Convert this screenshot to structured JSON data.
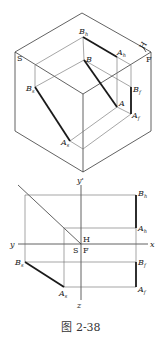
{
  "figure": {
    "caption": "图 2-38"
  },
  "upper_diagram": {
    "planes": {
      "S": "S",
      "F": "F",
      "H": "H"
    },
    "points": {
      "Bh": {
        "base": "B",
        "sub": "h"
      },
      "Ah": {
        "base": "A",
        "sub": "h"
      },
      "B": {
        "base": "B",
        "sub": ""
      },
      "A": {
        "base": "A",
        "sub": ""
      },
      "Bf": {
        "base": "B",
        "sub": "f"
      },
      "Af": {
        "base": "A",
        "sub": "f"
      },
      "Bs": {
        "base": "B",
        "sub": "s"
      },
      "As": {
        "base": "A",
        "sub": "s"
      }
    }
  },
  "lower_diagram": {
    "axes": {
      "x": "x",
      "y": "y",
      "y_prime": "y'",
      "z": "z"
    },
    "planes": {
      "H": "H",
      "S": "S",
      "F": "F"
    },
    "points": {
      "Bh": {
        "base": "B",
        "sub": "h"
      },
      "Ah": {
        "base": "A",
        "sub": "h"
      },
      "Bf": {
        "base": "B",
        "sub": "f"
      },
      "Af": {
        "base": "A",
        "sub": "f"
      },
      "Bs": {
        "base": "B",
        "sub": "s"
      },
      "As": {
        "base": "A",
        "sub": "s"
      }
    }
  }
}
